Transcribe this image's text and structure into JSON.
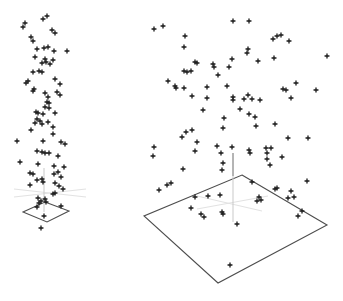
{
  "figure": {
    "width": 343,
    "height": 301,
    "background": "#ffffff",
    "marker_color": "#1a1a1a",
    "plane_edge_color": "#4d4d4d",
    "light_axis_color": "#e2e2e2",
    "z_axis_dark_color": "#6a6a6a",
    "z_axis_light_color": "#c9c9c9",
    "marker_glyph": "plus"
  },
  "chart_data": [
    {
      "name": "scatter3d-small",
      "type": "scatter",
      "projection": "3d",
      "title": "",
      "xlabel": "",
      "ylabel": "",
      "legend": null,
      "grid": false,
      "marker": "plus",
      "n_points": 84,
      "floor_plane_px": [
        [
          45,
          202
        ],
        [
          69,
          211
        ],
        [
          47,
          222
        ],
        [
          23,
          212
        ]
      ],
      "z_axis_px": [
        {
          "x1": 44,
          "y1": 168,
          "x2": 44,
          "y2": 212,
          "shade": "light"
        }
      ],
      "floor_axes_px": [
        [
          14,
          197,
          86,
          189
        ],
        [
          14,
          189,
          86,
          197
        ]
      ],
      "points_px": [
        [
          43,
          19
        ],
        [
          47,
          16
        ],
        [
          25,
          23
        ],
        [
          23,
          27
        ],
        [
          52,
          30
        ],
        [
          55,
          33
        ],
        [
          31,
          37
        ],
        [
          33,
          41
        ],
        [
          44,
          48
        ],
        [
          48,
          47
        ],
        [
          37,
          49
        ],
        [
          67,
          51
        ],
        [
          54,
          51
        ],
        [
          35,
          57
        ],
        [
          45,
          59
        ],
        [
          53,
          60
        ],
        [
          46,
          62
        ],
        [
          42,
          63
        ],
        [
          50,
          64
        ],
        [
          39,
          71
        ],
        [
          33,
          72
        ],
        [
          42,
          72
        ],
        [
          55,
          79
        ],
        [
          28,
          81
        ],
        [
          26,
          83
        ],
        [
          60,
          84
        ],
        [
          34,
          89
        ],
        [
          33,
          91
        ],
        [
          57,
          92
        ],
        [
          45,
          93
        ],
        [
          60,
          95
        ],
        [
          48,
          97
        ],
        [
          47,
          102
        ],
        [
          49,
          103
        ],
        [
          45,
          107
        ],
        [
          49,
          108
        ],
        [
          36,
          112
        ],
        [
          38,
          113
        ],
        [
          43,
          114
        ],
        [
          55,
          113
        ],
        [
          37,
          119
        ],
        [
          40,
          121
        ],
        [
          48,
          122
        ],
        [
          35,
          123
        ],
        [
          42,
          124
        ],
        [
          53,
          127
        ],
        [
          31,
          130
        ],
        [
          53,
          134
        ],
        [
          17,
          141
        ],
        [
          43,
          141
        ],
        [
          61,
          142
        ],
        [
          65,
          144
        ],
        [
          37,
          151
        ],
        [
          42,
          152
        ],
        [
          45,
          153
        ],
        [
          49,
          153
        ],
        [
          58,
          156
        ],
        [
          20,
          162
        ],
        [
          38,
          164
        ],
        [
          54,
          166
        ],
        [
          64,
          167
        ],
        [
          58,
          172
        ],
        [
          30,
          173
        ],
        [
          33,
          174
        ],
        [
          54,
          174
        ],
        [
          61,
          177
        ],
        [
          42,
          179
        ],
        [
          37,
          180
        ],
        [
          43,
          182
        ],
        [
          55,
          183
        ],
        [
          30,
          185
        ],
        [
          59,
          186
        ],
        [
          63,
          189
        ],
        [
          55,
          193
        ],
        [
          53,
          194
        ],
        [
          38,
          198
        ],
        [
          45,
          199
        ],
        [
          41,
          201
        ],
        [
          39,
          203
        ],
        [
          46,
          202
        ],
        [
          61,
          206
        ],
        [
          37,
          207
        ],
        [
          44,
          216
        ],
        [
          41,
          228
        ]
      ]
    },
    {
      "name": "scatter3d-large",
      "type": "scatter",
      "projection": "3d",
      "title": "",
      "xlabel": "",
      "ylabel": "",
      "legend": null,
      "grid": false,
      "marker": "plus",
      "n_points": 100,
      "floor_plane_px": [
        [
          242,
          175
        ],
        [
          327,
          225
        ],
        [
          218,
          283
        ],
        [
          144,
          216
        ]
      ],
      "z_axis_px": [
        {
          "x1": 233,
          "y1": 153,
          "x2": 233,
          "y2": 176,
          "shade": "dark"
        },
        {
          "x1": 233,
          "y1": 176,
          "x2": 233,
          "y2": 222,
          "shade": "light"
        }
      ],
      "floor_axes_px": [
        [
          197,
          209,
          268,
          196
        ],
        [
          197,
          196,
          262,
          211
        ]
      ],
      "points_px": [
        [
          154,
          29
        ],
        [
          163,
          26
        ],
        [
          185,
          36
        ],
        [
          184,
          47
        ],
        [
          233,
          21
        ],
        [
          249,
          21
        ],
        [
          248,
          49
        ],
        [
          247,
          53
        ],
        [
          232,
          59
        ],
        [
          195,
          62
        ],
        [
          197,
          63
        ],
        [
          213,
          64
        ],
        [
          214,
          67
        ],
        [
          229,
          67
        ],
        [
          184,
          71
        ],
        [
          187,
          72
        ],
        [
          191,
          71
        ],
        [
          218,
          75
        ],
        [
          168,
          81
        ],
        [
          175,
          86
        ],
        [
          207,
          87
        ],
        [
          227,
          86
        ],
        [
          296,
          83
        ],
        [
          283,
          89
        ],
        [
          286,
          90
        ],
        [
          316,
          90
        ],
        [
          273,
          39
        ],
        [
          277,
          36
        ],
        [
          281,
          35
        ],
        [
          289,
          41
        ],
        [
          258,
          61
        ],
        [
          274,
          58
        ],
        [
          327,
          56
        ],
        [
          176,
          88
        ],
        [
          184,
          88
        ],
        [
          192,
          96
        ],
        [
          207,
          98
        ],
        [
          233,
          97
        ],
        [
          233,
          100
        ],
        [
          244,
          99
        ],
        [
          248,
          95
        ],
        [
          252,
          99
        ],
        [
          260,
          100
        ],
        [
          291,
          98
        ],
        [
          203,
          110
        ],
        [
          240,
          109
        ],
        [
          249,
          114
        ],
        [
          255,
          117
        ],
        [
          224,
          118
        ],
        [
          223,
          128
        ],
        [
          256,
          126
        ],
        [
          275,
          124
        ],
        [
          192,
          130
        ],
        [
          186,
          132
        ],
        [
          182,
          137
        ],
        [
          288,
          138
        ],
        [
          308,
          138
        ],
        [
          154,
          147
        ],
        [
          153,
          156
        ],
        [
          197,
          142
        ],
        [
          195,
          151
        ],
        [
          217,
          146
        ],
        [
          232,
          147
        ],
        [
          221,
          153
        ],
        [
          266,
          148
        ],
        [
          271,
          148
        ],
        [
          249,
          150
        ],
        [
          267,
          153
        ],
        [
          282,
          157
        ],
        [
          250,
          153
        ],
        [
          223,
          163
        ],
        [
          267,
          159
        ],
        [
          270,
          165
        ],
        [
          183,
          169
        ],
        [
          222,
          170
        ],
        [
          252,
          182
        ],
        [
          171,
          183
        ],
        [
          167,
          185
        ],
        [
          159,
          190
        ],
        [
          220,
          195
        ],
        [
          195,
          197
        ],
        [
          208,
          196
        ],
        [
          259,
          197
        ],
        [
          191,
          208
        ],
        [
          201,
          214
        ],
        [
          204,
          217
        ],
        [
          222,
          212
        ],
        [
          223,
          214
        ],
        [
          237,
          224
        ],
        [
          275,
          189
        ],
        [
          277,
          188
        ],
        [
          307,
          181
        ],
        [
          291,
          191
        ],
        [
          288,
          198
        ],
        [
          294,
          197
        ],
        [
          257,
          201
        ],
        [
          261,
          200
        ],
        [
          302,
          211
        ],
        [
          298,
          216
        ],
        [
          230,
          265
        ]
      ]
    }
  ]
}
